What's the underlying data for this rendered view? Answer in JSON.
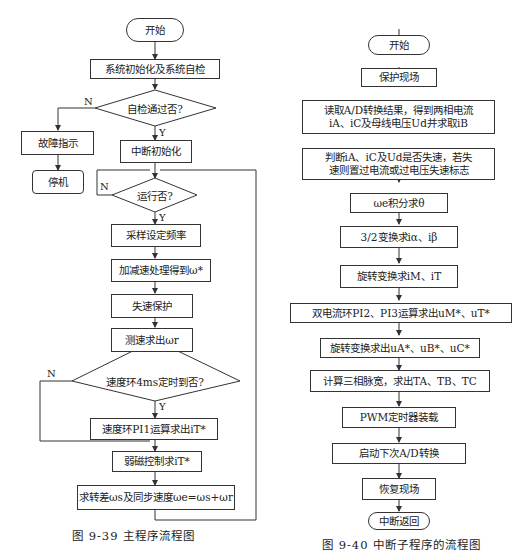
{
  "left_chart": {
    "caption": "图 9-39    主程序流程图",
    "start": "开始",
    "init": "系统初始化及系统自检",
    "selfcheck": "自检通过否?",
    "fault": "故障指示",
    "stop": "停机",
    "int_init": "中断初始化",
    "run": "运行否?",
    "sample": "采样设定频率",
    "accel": "加减速处理得到ω*",
    "stall": "失速保护",
    "measure": "测速求出ωr",
    "speed_timer": "速度环4ms定时到否?",
    "pi1": "速度环PI1运算求出iT*",
    "flux": "弱磁控制求iT*",
    "slip": "求转差ωs及同步速度ωe=ωs+ωr",
    "yes": "Y",
    "no": "N"
  },
  "right_chart": {
    "caption": "图 9-40    中断子程序的流程图",
    "start": "开始",
    "protect": "保护现场",
    "read_ad_1": "读取A/D转换结果，得到两相电流",
    "read_ad_2": "iA、iC及母线电压Ud并求取iB",
    "judge_1": "判断iA、iC及Ud是否失速，若失",
    "judge_2": "速则置过电流或过电压失速标志",
    "integrate": "ωe积分求θ",
    "t32": "3/2变换求iα、iβ",
    "rot1": "旋转变换求iM、iT",
    "dual_pi": "双电流环PI2、PI3运算求出uM*、uT*",
    "rot2": "旋转变换求出uA*、uB*、uC*",
    "pwm_calc": "计算三相脉宽，求出TA、TB、TC",
    "pwm_load": "PWM定时器装载",
    "next_ad": "启动下次A/D转换",
    "restore": "恢复现场",
    "ret": "中断返回"
  }
}
